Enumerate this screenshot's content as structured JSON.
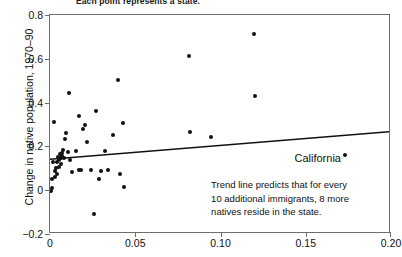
{
  "figure": {
    "caption": "Each point represents a state."
  },
  "axes": {
    "ylabel": "Change in native population, 1970–90",
    "xlabel": "",
    "yticks": [
      "0.8",
      "0.6",
      "0.4",
      "0.2",
      "0",
      "−0.2"
    ],
    "ytick_values": [
      0.8,
      0.6,
      0.4,
      0.2,
      0.0,
      -0.2
    ],
    "xticks": [
      "0",
      "0.05",
      "0.10",
      "0.15",
      "0.20"
    ],
    "xtick_values": [
      0,
      0.05,
      0.1,
      0.15,
      0.2
    ]
  },
  "annotations": {
    "california_label": "California",
    "note_line1": "Trend line predicts that for every",
    "note_line2": "10 additional immigrants, 8 more",
    "note_line3": "natives reside in the state."
  },
  "colors": {
    "point": "#111111",
    "trend": "#111111",
    "frame": "#6e6e6e",
    "text": "#111111",
    "background": "#ffffff"
  },
  "chart_data": {
    "type": "scatter",
    "title": "Each point represents a state.",
    "xlabel": "",
    "ylabel": "Change in native population, 1970–90",
    "xlim": [
      0.0,
      0.2
    ],
    "ylim": [
      -0.2,
      0.8
    ],
    "grid": false,
    "legend": null,
    "series": [
      {
        "name": "States",
        "marker": "filled-circle",
        "points": [
          [
            0.0005,
            -0.005
          ],
          [
            0.001,
            0.012
          ],
          [
            0.0012,
            0.052
          ],
          [
            0.0018,
            0.128
          ],
          [
            0.0022,
            0.31
          ],
          [
            0.003,
            0.088
          ],
          [
            0.0032,
            0.06
          ],
          [
            0.0035,
            0.1
          ],
          [
            0.004,
            0.072
          ],
          [
            0.0042,
            0.128
          ],
          [
            0.0048,
            0.152
          ],
          [
            0.0052,
            0.138
          ],
          [
            0.0055,
            0.108
          ],
          [
            0.0058,
            0.165
          ],
          [
            0.0062,
            0.148
          ],
          [
            0.0065,
            0.118
          ],
          [
            0.007,
            0.172
          ],
          [
            0.0072,
            0.158
          ],
          [
            0.0078,
            0.182
          ],
          [
            0.0082,
            0.145
          ],
          [
            0.009,
            0.235
          ],
          [
            0.0095,
            0.262
          ],
          [
            0.0105,
            0.175
          ],
          [
            0.011,
            0.445
          ],
          [
            0.0118,
            0.14
          ],
          [
            0.013,
            0.085
          ],
          [
            0.0155,
            0.178
          ],
          [
            0.0168,
            0.092
          ],
          [
            0.0172,
            0.34
          ],
          [
            0.0182,
            0.092
          ],
          [
            0.0195,
            0.278
          ],
          [
            0.0205,
            0.298
          ],
          [
            0.0215,
            0.222
          ],
          [
            0.0238,
            0.09
          ],
          [
            0.0258,
            -0.11
          ],
          [
            0.0272,
            0.362
          ],
          [
            0.0288,
            0.05
          ],
          [
            0.0302,
            0.088
          ],
          [
            0.0322,
            0.178
          ],
          [
            0.0342,
            0.09
          ],
          [
            0.0372,
            0.252
          ],
          [
            0.0398,
            0.505
          ],
          [
            0.0412,
            0.072
          ],
          [
            0.0428,
            0.308
          ],
          [
            0.0435,
            0.015
          ],
          [
            0.0818,
            0.612
          ],
          [
            0.0822,
            0.268
          ],
          [
            0.0942,
            0.245
          ],
          [
            0.1198,
            0.715
          ],
          [
            0.1202,
            0.43
          ],
          [
            0.173,
            0.16
          ]
        ]
      }
    ],
    "trendline": {
      "type": "linear",
      "x": [
        0.0,
        0.2
      ],
      "y": [
        0.135,
        0.262
      ],
      "description": "Trend line predicts that for every 10 additional immigrants, 8 more natives reside in the state."
    },
    "labeled_points": [
      {
        "label": "California",
        "x": 0.173,
        "y": 0.16
      }
    ]
  }
}
